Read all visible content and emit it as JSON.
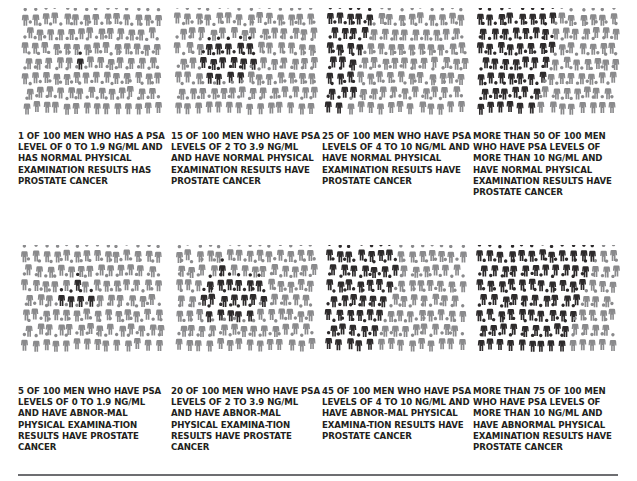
{
  "figure": {
    "colors": {
      "highlight": "#2d2a2b",
      "normal": "#8a8a8c",
      "text": "#231f20",
      "rule": "#6d6e71"
    },
    "panels": [
      {
        "id": "psa-0-1.9-normal",
        "count": 1,
        "comparator": "",
        "psa_range": "0 to 1.9 ng/mL",
        "exam": "normal",
        "caption": "1 of 100 men who has a PSA level of 0 to 1.9 ng/mL and has normal physical examination results has prostate cancer"
      },
      {
        "id": "psa-2-3.9-normal",
        "count": 15,
        "comparator": "",
        "psa_range": "2 to 3.9 ng/mL",
        "exam": "normal",
        "caption": "15 of 100 men who have PSA levels of 2 to 3.9 ng/mL and have normal physical examination results have prostate cancer"
      },
      {
        "id": "psa-4-10-normal",
        "count": 25,
        "comparator": "",
        "psa_range": "4 to 10 ng/mL",
        "exam": "normal",
        "caption": "25 of 100 men who have PSA levels of 4 to 10 ng/mL and have normal physical examination results have prostate cancer"
      },
      {
        "id": "psa-gt10-normal",
        "count": 50,
        "comparator": "more than",
        "psa_range": "more than 10 ng/mL",
        "exam": "normal",
        "caption": "More than 50 of 100 men who have PSA levels of more than 10 ng/mL and have normal physical examination results have prostate cancer"
      },
      {
        "id": "psa-0-1.9-abnormal",
        "count": 5,
        "comparator": "",
        "psa_range": "0 to 1.9 ng/mL",
        "exam": "abnormal",
        "caption": "5 of 100 men who have PSA levels of 0 to 1.9 ng/mL and have abnor-mal physical examina-tion results have prostate cancer"
      },
      {
        "id": "psa-2-3.9-abnormal",
        "count": 20,
        "comparator": "",
        "psa_range": "2 to 3.9 ng/mL",
        "exam": "abnormal",
        "caption": "20 of 100 men who have PSA levels of 2 to 3.9 ng/mL and have abnor-mal physical examina-tion results have prostate cancer"
      },
      {
        "id": "psa-4-10-abnormal",
        "count": 45,
        "comparator": "",
        "psa_range": "4 to 10 ng/mL",
        "exam": "abnormal",
        "caption": "45 of 100 men who have PSA levels of 4 to 10 ng/mL and have abnor-mal physical examina-tion results have prostate cancer"
      },
      {
        "id": "psa-gt10-abnormal",
        "count": 75,
        "comparator": "more than",
        "psa_range": "more than 10 ng/mL",
        "exam": "abnormal",
        "caption": "More than 75 of 100 men who have PSA levels of more than 10 ng/mL and have abnormal physical examination results have prostate cancer"
      }
    ],
    "total_per_panel": 100
  }
}
